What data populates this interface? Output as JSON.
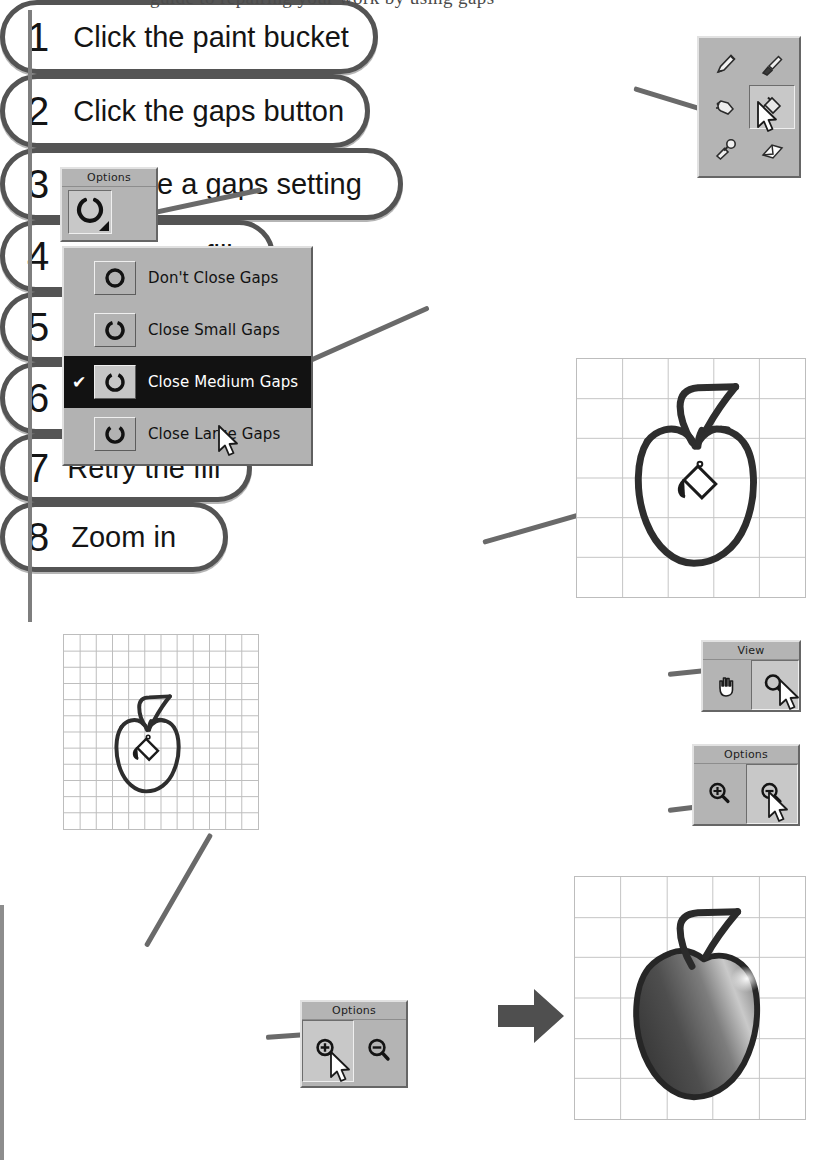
{
  "page": {
    "top_text_fragment": "guide to repairing your work by using gaps",
    "background_color": "#ffffff",
    "rule_color": "#7e7e7e"
  },
  "steps": [
    {
      "num": "1",
      "text": "Click the paint bucket"
    },
    {
      "num": "2",
      "text": "Click the gaps button"
    },
    {
      "num": "3",
      "text": "Choose a gaps setting"
    },
    {
      "num": "4",
      "text": "Attempt a fill"
    },
    {
      "num": "5",
      "text": "Click zoom"
    },
    {
      "num": "6",
      "text": "Click zoom out"
    },
    {
      "num": "7",
      "text": "Retry the fill"
    },
    {
      "num": "8",
      "text": "Zoom in"
    }
  ],
  "tool_palette": {
    "tools": [
      {
        "name": "pencil-tool",
        "icon": "pencil-icon",
        "selected": false
      },
      {
        "name": "paintbrush-tool",
        "icon": "paintbrush-icon",
        "selected": false
      },
      {
        "name": "airbrush-tool",
        "icon": "airbrush-icon",
        "selected": false
      },
      {
        "name": "paint-bucket-tool",
        "icon": "paint-bucket-icon",
        "selected": true
      },
      {
        "name": "eyedropper-tool",
        "icon": "eyedropper-icon",
        "selected": false
      },
      {
        "name": "eraser-tool",
        "icon": "eraser-icon",
        "selected": false
      }
    ],
    "cursor": "arrow-cursor"
  },
  "options_panel_gaps": {
    "title": "Options",
    "button": {
      "name": "gaps-button",
      "icon": "broken-circle-icon",
      "has_dropdown": true
    }
  },
  "gaps_menu": {
    "items": [
      {
        "label": "Don't Close Gaps",
        "checked": false,
        "icon": "closed-circle-icon"
      },
      {
        "label": "Close Small Gaps",
        "checked": false,
        "icon": "small-gap-circle-icon"
      },
      {
        "label": "Close Medium Gaps",
        "checked": true,
        "icon": "medium-gap-circle-icon"
      },
      {
        "label": "Close Large Gaps",
        "checked": false,
        "icon": "large-gap-circle-icon"
      }
    ],
    "check_glyph": "✔",
    "highlight_color": "#121212",
    "highlight_text_color": "#ffffff"
  },
  "view_panel": {
    "title": "View",
    "buttons": [
      {
        "label": "",
        "name": "hand-tool",
        "icon": "hand-icon",
        "selected": false
      },
      {
        "label": "",
        "name": "zoom-tool",
        "icon": "magnifier-icon",
        "selected": true
      }
    ]
  },
  "options_panel_zoom_out": {
    "title": "Options",
    "buttons": [
      {
        "name": "zoom-in-button",
        "icon": "magnifier-plus-icon",
        "selected": false
      },
      {
        "name": "zoom-out-button",
        "icon": "magnifier-minus-icon",
        "selected": true
      }
    ]
  },
  "options_panel_zoom_in": {
    "title": "Options",
    "buttons": [
      {
        "name": "zoom-in-button",
        "icon": "magnifier-plus-icon",
        "selected": true
      },
      {
        "name": "zoom-out-button",
        "icon": "magnifier-minus-icon",
        "selected": false
      }
    ]
  },
  "canvases": {
    "attempt_fill": {
      "name": "canvas-attempt-fill",
      "grid_cols": 5,
      "grid_rows": 6,
      "apple_state": "outline",
      "cursor": "paint-bucket-cursor"
    },
    "zoomed_out": {
      "name": "canvas-zoomed-out",
      "grid_cols": 12,
      "grid_rows": 12,
      "apple_state": "outline",
      "cursor": "paint-bucket-cursor"
    },
    "result": {
      "name": "canvas-result",
      "grid_cols": 5,
      "grid_rows": 6,
      "apple_state": "filled",
      "cursor": "none"
    }
  },
  "result_arrow": {
    "name": "result-arrow-icon",
    "direction": "right",
    "color": "#4a4a4a"
  }
}
